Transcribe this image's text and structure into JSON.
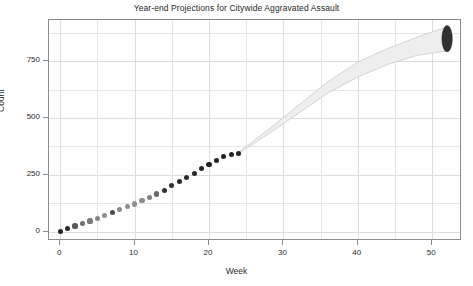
{
  "chart_data": {
    "type": "scatter",
    "title": "Year-end Projections for Citywide Aggravated Assault",
    "xlabel": "Week",
    "ylabel": "Count",
    "xlim": [
      -1.5,
      54
    ],
    "ylim": [
      -40,
      930
    ],
    "grid": true,
    "legend_position": "none",
    "x_ticks": [
      0,
      10,
      20,
      30,
      40,
      50
    ],
    "y_ticks": [
      0,
      250,
      500,
      750
    ],
    "x_minor_gridlines": [
      5,
      15,
      25,
      35,
      45
    ],
    "y_minor_gridlines": [
      125,
      375,
      625,
      875
    ],
    "observed_series": {
      "name": "Observed cumulative count",
      "x": [
        0,
        1,
        2,
        3,
        4,
        5,
        6,
        7,
        8,
        9,
        10,
        11,
        12,
        13,
        14,
        15,
        16,
        17,
        18,
        19,
        20,
        21,
        22,
        23,
        24
      ],
      "y": [
        3,
        14,
        26,
        38,
        48,
        60,
        72,
        86,
        98,
        110,
        122,
        136,
        150,
        166,
        182,
        203,
        222,
        240,
        258,
        278,
        296,
        314,
        331,
        340,
        345
      ],
      "marker_shades": [
        "#262626",
        "#262626",
        "#5a5a5a",
        "#6e6e6e",
        "#7a7a7a",
        "#868686",
        "#8e8e8e",
        "#4a4a4a",
        "#8a8a8a",
        "#8e8e8e",
        "#909090",
        "#8a8a8a",
        "#828282",
        "#6a6a6a",
        "#2e2e2e",
        "#303030",
        "#2a2a2a",
        "#2c2c2c",
        "#282828",
        "#262626",
        "#242424",
        "#242424",
        "#222222",
        "#222222",
        "#222222"
      ]
    },
    "projection_band": {
      "name": "Projection interval",
      "x": [
        24,
        28,
        32,
        36,
        40,
        44,
        48,
        52
      ],
      "lower": [
        345,
        430,
        520,
        610,
        680,
        735,
        775,
        795
      ],
      "upper": [
        350,
        450,
        555,
        660,
        745,
        805,
        855,
        900
      ],
      "fill_color": "#eeeeee",
      "edge_color": "#c4c4c4"
    },
    "terminal_density": {
      "x": 52,
      "center": 848,
      "low": 790,
      "high": 905,
      "color": "#303030"
    }
  }
}
